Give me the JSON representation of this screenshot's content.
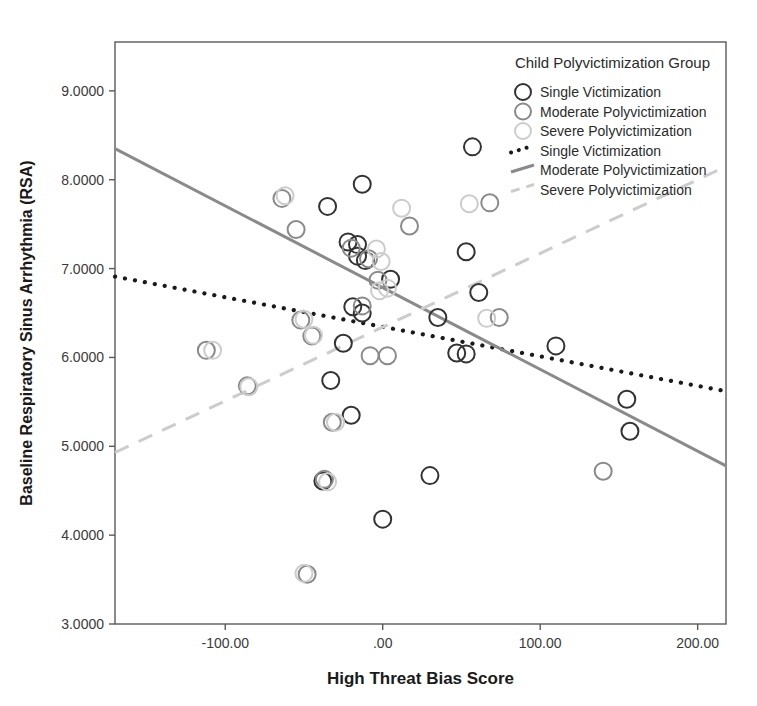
{
  "chart_data": {
    "type": "scatter",
    "title": "",
    "xlabel": "High Threat Bias Score",
    "ylabel": "Baseline Respiratory Sinus Arrhythmia (RSA)",
    "xlim": [
      -170,
      218
    ],
    "ylim": [
      3.0,
      9.55
    ],
    "grid": false,
    "xticks": [
      -100,
      0,
      100,
      200
    ],
    "xticklabels": [
      "-100.00",
      ".00",
      "100.00",
      "200.00"
    ],
    "yticks": [
      3,
      4,
      5,
      6,
      7,
      8,
      9
    ],
    "yticklabels": [
      "3.0000",
      "4.0000",
      "5.0000",
      "6.0000",
      "7.0000",
      "8.0000",
      "9.0000"
    ],
    "legend": {
      "title": "Child Polyvictimization Group",
      "position": "top-right",
      "marker_entries": [
        {
          "label": "Single Victimization",
          "color": "#333333"
        },
        {
          "label": "Moderate Polyvictimization",
          "color": "#8a8a8a"
        },
        {
          "label": "Severe Polyvictimization",
          "color": "#cccccc"
        }
      ],
      "line_entries": [
        {
          "label": "Single Victimization",
          "color": "#1a1a1a",
          "style": "dotted"
        },
        {
          "label": "Moderate Polyvictimization",
          "color": "#8a8a8a",
          "style": "solid"
        },
        {
          "label": "Severe Polyvictimization",
          "color": "#cccccc",
          "style": "dashed"
        }
      ]
    },
    "series": [
      {
        "name": "Single Victimization",
        "color": "#333333",
        "points": [
          [
            -35,
            7.7
          ],
          [
            -13,
            7.95
          ],
          [
            -22,
            7.3
          ],
          [
            -16,
            7.14
          ],
          [
            -11,
            7.09
          ],
          [
            -33,
            5.74
          ],
          [
            -19,
            6.57
          ],
          [
            -13,
            6.5
          ],
          [
            -25,
            6.16
          ],
          [
            -20,
            5.35
          ],
          [
            0,
            4.18
          ],
          [
            35,
            6.45
          ],
          [
            47,
            6.05
          ],
          [
            53,
            6.04
          ],
          [
            57,
            8.37
          ],
          [
            53,
            7.19
          ],
          [
            61,
            6.73
          ],
          [
            110,
            6.13
          ],
          [
            155,
            5.53
          ],
          [
            157,
            5.17
          ],
          [
            30,
            4.67
          ],
          [
            -38,
            4.61
          ],
          [
            -16,
            7.27
          ],
          [
            5,
            6.88
          ]
        ]
      },
      {
        "name": "Moderate Polyvictimization",
        "color": "#8a8a8a",
        "points": [
          [
            -64,
            7.79
          ],
          [
            -55,
            7.44
          ],
          [
            -20,
            7.23
          ],
          [
            -9,
            7.11
          ],
          [
            -3,
            6.87
          ],
          [
            -13,
            6.58
          ],
          [
            -8,
            6.02
          ],
          [
            -45,
            6.24
          ],
          [
            -32,
            5.27
          ],
          [
            -52,
            6.42
          ],
          [
            -86,
            5.68
          ],
          [
            -112,
            6.08
          ],
          [
            17,
            7.48
          ],
          [
            74,
            6.45
          ],
          [
            68,
            7.74
          ],
          [
            -37,
            4.63
          ],
          [
            -48,
            3.56
          ],
          [
            140,
            4.72
          ],
          [
            3,
            6.02
          ]
        ]
      },
      {
        "name": "Severe Polyvictimization",
        "color": "#cccccc",
        "points": [
          [
            -62,
            7.82
          ],
          [
            12,
            7.68
          ],
          [
            -4,
            7.22
          ],
          [
            3,
            6.78
          ],
          [
            -1,
            7.08
          ],
          [
            55,
            7.73
          ],
          [
            66,
            6.44
          ],
          [
            -35,
            4.6
          ],
          [
            -50,
            3.57
          ],
          [
            -30,
            5.27
          ],
          [
            -108,
            6.08
          ],
          [
            -85,
            5.67
          ],
          [
            -50,
            6.43
          ],
          [
            -44,
            6.25
          ],
          [
            -2,
            6.75
          ]
        ]
      }
    ],
    "trend_lines": [
      {
        "name": "Single Victimization",
        "style": "dotted",
        "color": "#1a1a1a",
        "x_start": -170,
        "y_start": 6.91,
        "x_end": 218,
        "y_end": 5.62
      },
      {
        "name": "Moderate Polyvictimization",
        "style": "solid",
        "color": "#8a8a8a",
        "x_start": -170,
        "y_start": 8.35,
        "x_end": 218,
        "y_end": 4.78
      },
      {
        "name": "Severe Polyvictimization",
        "style": "dashed",
        "color": "#cccccc",
        "x_start": -170,
        "y_start": 4.93,
        "x_end": 218,
        "y_end": 8.15
      }
    ]
  }
}
